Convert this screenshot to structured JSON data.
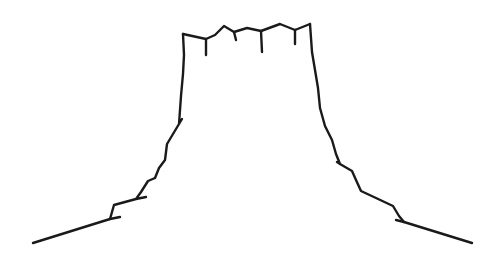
{
  "drawing": {
    "subject": "mesa-line-drawing",
    "stroke_color": "#1a1a1a",
    "background": "#ffffff"
  }
}
